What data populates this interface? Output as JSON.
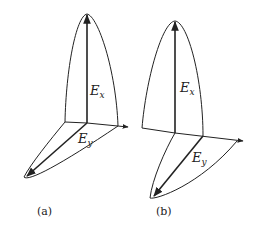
{
  "figure": {
    "panels": [
      {
        "id": "a",
        "caption": "(a)",
        "vector_x_label": "E",
        "vector_x_sub": "x",
        "vector_y_label": "E",
        "vector_y_sub": "y"
      },
      {
        "id": "b",
        "caption": "(b)",
        "vector_x_label": "E",
        "vector_x_sub": "x",
        "vector_y_label": "E",
        "vector_y_sub": "y"
      }
    ],
    "colors": {
      "line": "#222222",
      "background": "#ffffff"
    }
  }
}
